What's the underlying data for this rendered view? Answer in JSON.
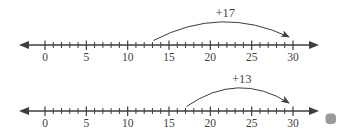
{
  "diagram": {
    "background": "#ffffff",
    "stroke_color": "#3e3e3e",
    "text_color": "#3e3e3e",
    "number_lines": [
      {
        "name": "number-line-top",
        "min": 0,
        "max": 30,
        "tick_step": 1,
        "label_step": 5,
        "tick_labels": [
          "0",
          "5",
          "10",
          "15",
          "20",
          "25",
          "30"
        ],
        "jump": {
          "from": 13,
          "to": 30,
          "label": "+17"
        }
      },
      {
        "name": "number-line-bottom",
        "min": 0,
        "max": 30,
        "tick_step": 1,
        "label_step": 5,
        "tick_labels": [
          "0",
          "5",
          "10",
          "15",
          "20",
          "25",
          "30"
        ],
        "jump": {
          "from": 17,
          "to": 30,
          "label": "+13"
        }
      }
    ],
    "marker_dot": {
      "shape": "rounded-square",
      "color": "#9a9a9a"
    }
  },
  "chart_data": {
    "type": "number-line",
    "lines": [
      {
        "range": [
          0,
          30
        ],
        "tick_interval": 1,
        "label_interval": 5,
        "labels": [
          0,
          5,
          10,
          15,
          20,
          25,
          30
        ],
        "jump": {
          "start": 13,
          "increment": 17,
          "end": 30,
          "annotation": "+17"
        }
      },
      {
        "range": [
          0,
          30
        ],
        "tick_interval": 1,
        "label_interval": 5,
        "labels": [
          0,
          5,
          10,
          15,
          20,
          25,
          30
        ],
        "jump": {
          "start": 17,
          "increment": 13,
          "end": 30,
          "annotation": "+13"
        }
      }
    ]
  }
}
